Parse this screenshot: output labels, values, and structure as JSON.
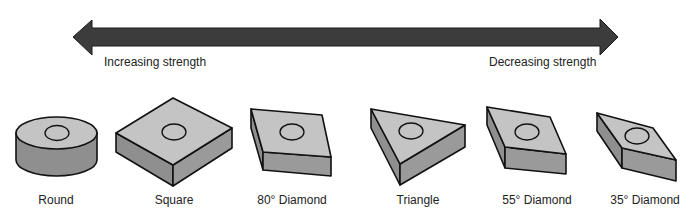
{
  "arrow": {
    "left_label": "Increasing strength",
    "right_label": "Decreasing strength",
    "color": "#3a3a3a"
  },
  "inserts": [
    {
      "name": "Round",
      "label": "Round"
    },
    {
      "name": "Square",
      "label": "Square"
    },
    {
      "name": "80° Diamond",
      "label": "80° Diamond"
    },
    {
      "name": "Triangle",
      "label": "Triangle"
    },
    {
      "name": "55° Diamond",
      "label": "55° Diamond"
    },
    {
      "name": "35° Diamond",
      "label": "35° Diamond"
    }
  ],
  "colors": {
    "top_face": "#c4c4c4",
    "side_face": "#8f8f8f",
    "outline": "#111111"
  }
}
